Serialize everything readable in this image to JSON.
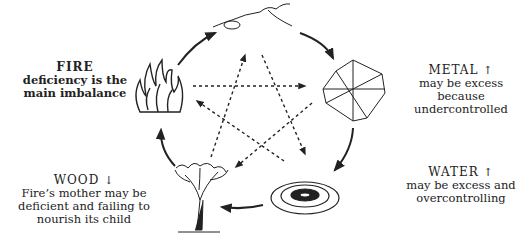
{
  "diagram": {
    "type": "five-elements-cycle",
    "nodes": [
      {
        "id": "earth",
        "icon": "mountain-icon",
        "x": 270,
        "y": 18
      },
      {
        "id": "metal",
        "icon": "crystal-icon",
        "x": 352,
        "y": 93
      },
      {
        "id": "water",
        "icon": "ripple-icon",
        "x": 320,
        "y": 198
      },
      {
        "id": "wood",
        "icon": "tree-icon",
        "x": 203,
        "y": 198
      },
      {
        "id": "fire",
        "icon": "flame-icon",
        "x": 162,
        "y": 94
      }
    ],
    "sheng_cycle": [
      "earth",
      "metal",
      "water",
      "wood",
      "fire",
      "earth"
    ],
    "ke_cycle_style": "dashed"
  },
  "labels": {
    "fire": {
      "title": "FIRE",
      "desc": "deficiency is the main imbalance"
    },
    "metal": {
      "title": "METAL",
      "arrow": "↑",
      "desc": "may be excess because undercontrolled"
    },
    "water": {
      "title": "WATER",
      "arrow": "↑",
      "desc": "may be excess and overcontrolling"
    },
    "wood": {
      "title": "WOOD",
      "arrow": "↓",
      "desc": "Fire’s mother may be deficient and failing to nourish its child"
    }
  }
}
